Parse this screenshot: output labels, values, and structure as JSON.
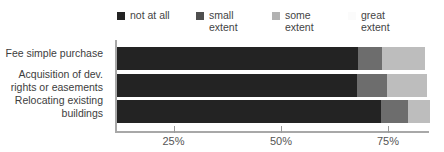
{
  "chart_data": {
    "type": "bar",
    "orientation": "horizontal",
    "stacked": true,
    "percent": true,
    "title": "",
    "subtitle": "",
    "xlabel": "",
    "ylabel": "",
    "xlim": [
      0,
      100
    ],
    "grid": false,
    "legend_position": "top",
    "categories": [
      "Fee simple purchase",
      "Acquisition of dev.\nrights or easements",
      "Relocating existing\nbuildings"
    ],
    "tick_labels": [
      "25%",
      "50%",
      "75%"
    ],
    "tick_values": [
      25,
      50,
      75
    ],
    "series": [
      {
        "name": "not at all",
        "color": "#232323",
        "values": [
          56.0,
          55.8,
          61.5
        ]
      },
      {
        "name": "small extent",
        "color": "#6d6d6d",
        "values": [
          5.6,
          7.0,
          6.3
        ]
      },
      {
        "name": "some extent",
        "color": "#bdbdbd",
        "values": [
          10.0,
          9.3,
          5.1
        ]
      },
      {
        "name": "great extent",
        "color": "#fdfdfd",
        "values": [
          0.0,
          0.0,
          0.0
        ]
      }
    ],
    "legend": [
      {
        "label": "not at all",
        "swatch": "#232323"
      },
      {
        "label": "small\nextent",
        "swatch": "#4f4f4f"
      },
      {
        "label": "some\nextent",
        "swatch": "#b2b2b2"
      },
      {
        "label": "great\nextent",
        "swatch": "#fbfbfb"
      }
    ],
    "bars": [
      {
        "category": "Fee simple purchase",
        "segments": [
          {
            "series": "not at all",
            "start_px": 117,
            "end_px": 358
          },
          {
            "series": "small extent",
            "start_px": 358,
            "end_px": 382
          },
          {
            "series": "some extent",
            "start_px": 382,
            "end_px": 425
          },
          {
            "series": "great extent",
            "start_px": 425,
            "end_px": 425
          }
        ]
      },
      {
        "category": "Acquisition of dev. rights or easements",
        "segments": [
          {
            "series": "not at all",
            "start_px": 117,
            "end_px": 357
          },
          {
            "series": "small extent",
            "start_px": 357,
            "end_px": 387
          },
          {
            "series": "some extent",
            "start_px": 387,
            "end_px": 427
          },
          {
            "series": "great extent",
            "start_px": 427,
            "end_px": 427
          }
        ]
      },
      {
        "category": "Relocating existing buildings",
        "segments": [
          {
            "series": "not at all",
            "start_px": 117,
            "end_px": 381
          },
          {
            "series": "small extent",
            "start_px": 381,
            "end_px": 408
          },
          {
            "series": "some extent",
            "start_px": 408,
            "end_px": 430
          },
          {
            "series": "great extent",
            "start_px": 430,
            "end_px": 430
          }
        ]
      }
    ]
  }
}
